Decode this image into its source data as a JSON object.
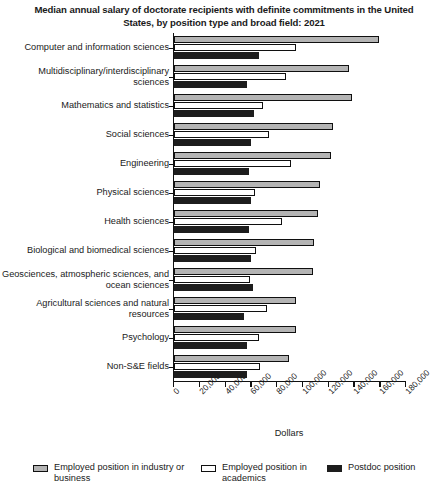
{
  "chart_data": {
    "type": "bar",
    "orientation": "horizontal",
    "grouped": true,
    "title": "Median annual salary of doctorate recipients with definite commitments in the United States, by position type and broad field: 2021",
    "xlabel": "Dollars",
    "ylabel": "",
    "xlim": [
      0,
      180000
    ],
    "xticks": [
      0,
      20000,
      40000,
      60000,
      80000,
      100000,
      120000,
      140000,
      160000,
      180000
    ],
    "xtick_labels": [
      "0",
      "20,000",
      "40,000",
      "60,000",
      "80,000",
      "100,000",
      "120,000",
      "140,000",
      "160,000",
      "180,000"
    ],
    "grid": false,
    "legend_position": "bottom",
    "categories": [
      "Computer and information sciences",
      "Multidisciplinary/interdisciplinary sciences",
      "Mathematics and statistics",
      "Social sciences",
      "Engineering",
      "Physical sciences",
      "Health sciences",
      "Biological and biomedical sciences",
      "Geosciences, atmospheric sciences, and ocean sciences",
      "Agricultural sciences and natural resources",
      "Psychology",
      "Non-S&E fields"
    ],
    "series": [
      {
        "name": "Employed position in industry or business",
        "color": "#b4b4b4",
        "values": [
          159000,
          136000,
          138000,
          123000,
          122000,
          113000,
          112000,
          109000,
          108000,
          95000,
          95000,
          89000
        ]
      },
      {
        "name": "Employed position in academics",
        "color": "#ffffff",
        "values": [
          95000,
          87000,
          69000,
          74000,
          91000,
          63000,
          84000,
          64000,
          59000,
          72000,
          66000,
          67000
        ]
      },
      {
        "name": "Postdoc position",
        "color": "#1d1d1d",
        "values": [
          66000,
          57000,
          62000,
          60000,
          58000,
          60000,
          58000,
          60000,
          61000,
          54000,
          57000,
          57000
        ]
      }
    ]
  },
  "legend": {
    "items": [
      {
        "label": "Employed position in industry or business",
        "swatch": "series-industry"
      },
      {
        "label": "Employed position in academics",
        "swatch": "series-academics"
      },
      {
        "label": "Postdoc position",
        "swatch": "series-postdoc"
      }
    ]
  }
}
